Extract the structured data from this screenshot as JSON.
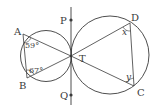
{
  "diagram": {
    "type": "geometry",
    "points": {
      "A": "A",
      "B": "B",
      "C": "C",
      "D": "D",
      "P": "P",
      "Q": "Q",
      "T": "T"
    },
    "angles": {
      "angle_A": "59°",
      "angle_B": "67°",
      "angle_D": "x",
      "angle_C": "y"
    },
    "colors": {
      "stroke": "#3a3a3a",
      "background": "#ffffff"
    }
  }
}
